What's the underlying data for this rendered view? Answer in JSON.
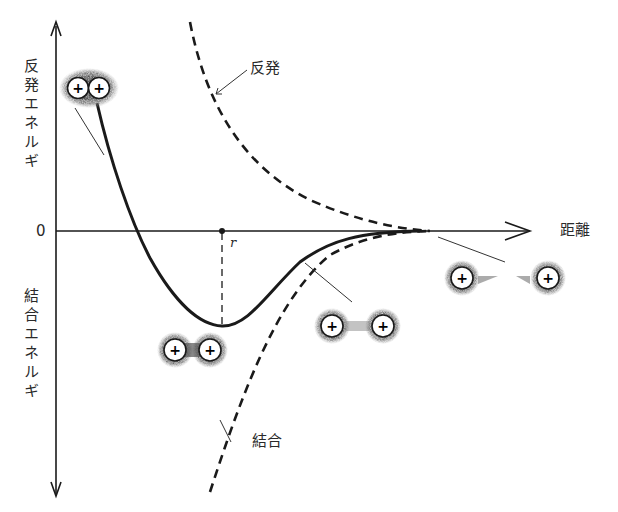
{
  "diagram": {
    "type": "potential-energy-curve",
    "y_axis": {
      "upper_label": "反発エネルギ",
      "lower_label": "結合エネルギ",
      "zero_label": "0"
    },
    "x_axis": {
      "label": "距離"
    },
    "equilibrium_label": "r",
    "curves": [
      {
        "name": "repulsion",
        "label": "反発",
        "style": "dashed"
      },
      {
        "name": "attraction",
        "label": "結合",
        "style": "dashed"
      },
      {
        "name": "net-potential",
        "label": "",
        "style": "solid"
      }
    ],
    "atom_pairs": [
      {
        "state": "compressed",
        "charge": "+",
        "count": 2
      },
      {
        "state": "equilibrium",
        "charge": "+",
        "count": 2
      },
      {
        "state": "approaching",
        "charge": "+",
        "count": 2
      },
      {
        "state": "separated",
        "charge": "+",
        "count": 2
      }
    ],
    "colors": {
      "line": "#1a1a1a",
      "cloud": "#8a8a8a",
      "background": "#ffffff"
    }
  }
}
